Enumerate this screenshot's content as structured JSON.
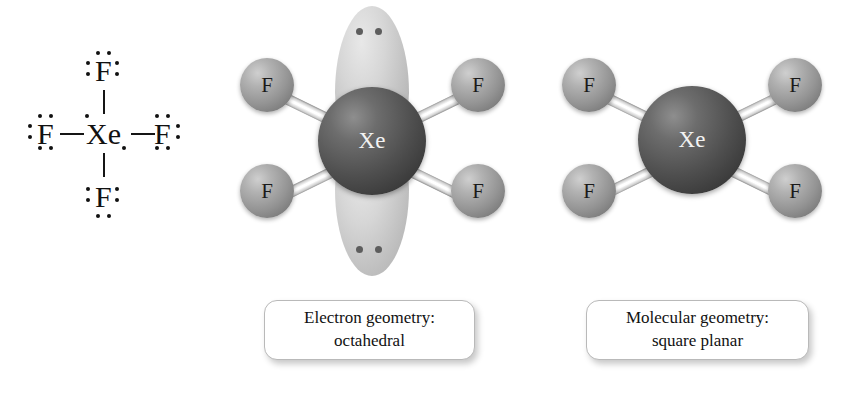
{
  "figure": {
    "molecule_formula": "XeF4",
    "background_color": "#ffffff"
  },
  "lewis_structure": {
    "central_atom": "Xe",
    "terminal_atoms": [
      "F",
      "F",
      "F",
      "F"
    ],
    "central_label": "Xe",
    "f_top": "F",
    "f_left": "F",
    "f_right": "F",
    "f_bottom": "F",
    "central_lone_pairs": 2,
    "terminal_lone_pairs_each": 3,
    "bond_count": 4
  },
  "electron_geometry_model": {
    "center_label": "Xe",
    "ligands": [
      {
        "label": "F",
        "position": "upper-left"
      },
      {
        "label": "F",
        "position": "upper-right"
      },
      {
        "label": "F",
        "position": "lower-left"
      },
      {
        "label": "F",
        "position": "lower-right"
      }
    ],
    "lone_pair_lobes": [
      {
        "position": "top",
        "electron_dots": 2
      },
      {
        "position": "bottom",
        "electron_dots": 2
      }
    ],
    "caption_line1": "Electron geometry:",
    "caption_line2": "octahedral"
  },
  "molecular_geometry_model": {
    "center_label": "Xe",
    "ligands": [
      {
        "label": "F",
        "position": "upper-left"
      },
      {
        "label": "F",
        "position": "upper-right"
      },
      {
        "label": "F",
        "position": "lower-left"
      },
      {
        "label": "F",
        "position": "lower-right"
      }
    ],
    "lone_pair_lobes": [],
    "caption_line1": "Molecular geometry:",
    "caption_line2": "square planar"
  },
  "colors": {
    "xenon_sphere": "#4f4f4f",
    "fluorine_sphere": "#949494",
    "bond": "#ffffff",
    "lobe": "#c2c2c2",
    "text": "#111111",
    "caption_border": "#b9b9b9"
  }
}
